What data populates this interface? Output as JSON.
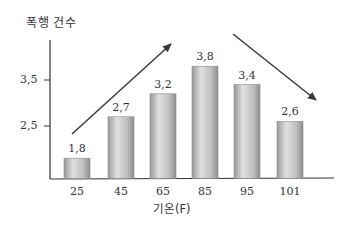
{
  "chart_data": {
    "type": "bar",
    "title": "",
    "ylabel": "폭행 건수",
    "xlabel": "기온(F)",
    "categories": [
      "25",
      "45",
      "65",
      "85",
      "95",
      "101"
    ],
    "values": [
      1.8,
      2.7,
      3.2,
      3.8,
      3.4,
      2.6
    ],
    "value_labels": [
      "1,8",
      "2,7",
      "3,2",
      "3,8",
      "3,4",
      "2,6"
    ],
    "yticks": [
      {
        "value": 2.5,
        "label": "2,5"
      },
      {
        "value": 3.5,
        "label": "3,5"
      }
    ],
    "grid": false,
    "legend": null,
    "annotations": [
      {
        "type": "arrow",
        "direction": "up-right",
        "description": "rising trend from 25 to 85"
      },
      {
        "type": "arrow",
        "direction": "down-right",
        "description": "falling trend from 85 to 101"
      }
    ],
    "colors": {
      "bar_light": "#e6e6e6",
      "bar_dark": "#8c8c8c",
      "axis": "#333333",
      "arrow": "#3a3a3a"
    }
  }
}
